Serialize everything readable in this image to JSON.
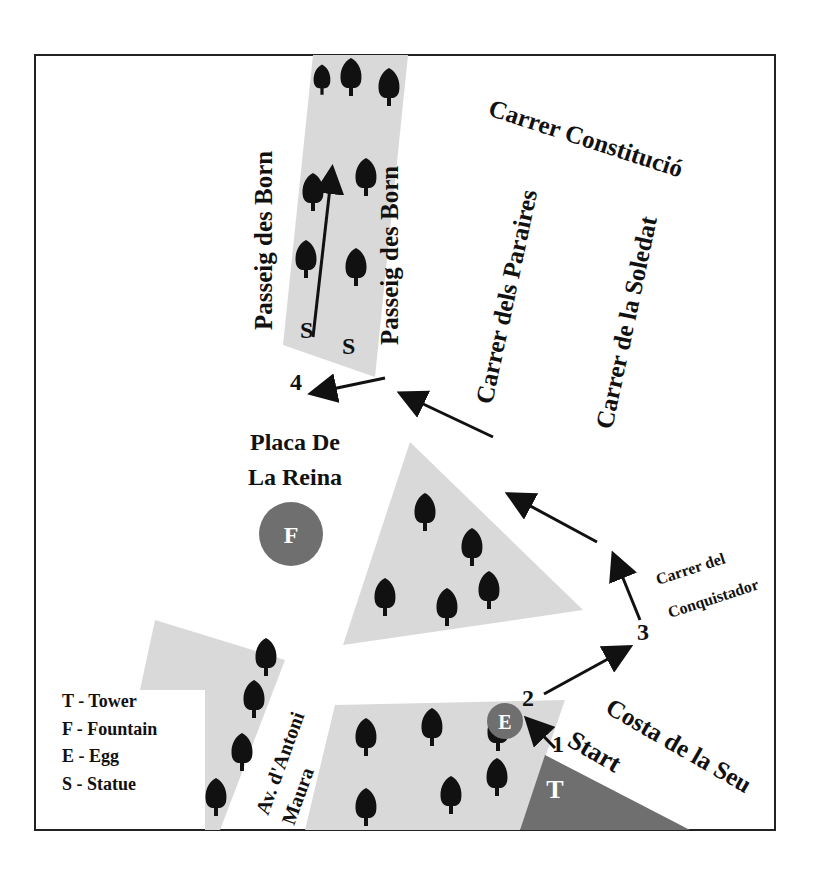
{
  "map": {
    "streets": {
      "passeig_left": "Passeig des Born",
      "passeig_right": "Passeig des Born",
      "constitucio": "Carrer Constitució",
      "paraires": "Carrer dels Paraires",
      "soledat": "Carrer de la Soledat",
      "conquistador_1": "Carrer del",
      "conquistador_2": "Conquistador",
      "costa": "Costa de la Seu",
      "antoni_1": "Av. d'Antoni",
      "antoni_2": "Maura"
    },
    "places": {
      "placa_1": "Placa De",
      "placa_2": "La Reina"
    },
    "markers": {
      "fountain": "F",
      "egg": "E",
      "tower": "T",
      "statue_left": "S",
      "statue_right": "S"
    },
    "route": {
      "start_label": "Start",
      "steps": [
        "1",
        "2",
        "3",
        "4"
      ]
    },
    "legend": [
      "T - Tower",
      "F - Fountain",
      "E - Egg",
      "S - Statue"
    ],
    "colors": {
      "park": "#d9d9d9",
      "marker": "#6f6f6f",
      "ink": "#111111"
    }
  }
}
